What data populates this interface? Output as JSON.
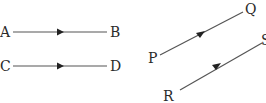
{
  "diagram": {
    "segments": [
      {
        "from": "A",
        "to": "B",
        "direction": "A to B"
      },
      {
        "from": "C",
        "to": "D",
        "direction": "C to D"
      },
      {
        "from": "P",
        "to": "Q",
        "direction": "P to Q"
      },
      {
        "from": "R",
        "to": "S",
        "direction": "R to S"
      }
    ],
    "labels": {
      "a": "A",
      "b": "B",
      "c": "C",
      "d": "D",
      "p": "P",
      "q": "Q",
      "r": "R",
      "s": "S"
    }
  }
}
